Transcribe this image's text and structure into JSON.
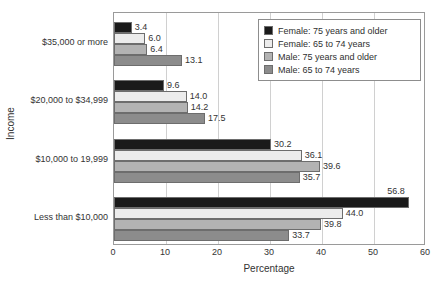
{
  "clipped_title_fragment": "",
  "chart_data": {
    "type": "bar",
    "orientation": "horizontal",
    "title": "",
    "xlabel": "Percentage",
    "ylabel": "Income",
    "xlim": [
      0,
      60
    ],
    "xticks": [
      0,
      10,
      20,
      30,
      40,
      50,
      60
    ],
    "grid": true,
    "legend_position": "top-right",
    "categories": [
      "$35,000 or more",
      "$20,000 to $34,999",
      "$10,000 to 19,999",
      "Less than $10,000"
    ],
    "series": [
      {
        "name": "Female: 75 years and older",
        "color": "#1a1a1a",
        "values": [
          3.4,
          9.6,
          30.2,
          56.8
        ],
        "labels": [
          "3.4",
          "9.6",
          "30.2",
          "56.8"
        ]
      },
      {
        "name": "Female: 65 to 74 years",
        "color": "#ececec",
        "values": [
          6.0,
          14.0,
          36.1,
          44.0
        ],
        "labels": [
          "6.0",
          "14.0",
          "36.1",
          "44.0"
        ]
      },
      {
        "name": "Male: 75 years and older",
        "color": "#b3b3b3",
        "values": [
          6.4,
          14.2,
          39.6,
          39.8
        ],
        "labels": [
          "6.4",
          "14.2",
          "39.6",
          "39.8"
        ]
      },
      {
        "name": "Male: 65 to 74 years",
        "color": "#8c8c8c",
        "values": [
          13.1,
          17.5,
          35.7,
          33.7
        ],
        "labels": [
          "13.1",
          "17.5",
          "35.7",
          "33.7"
        ]
      }
    ]
  },
  "axis": {
    "x_title": "Percentage",
    "y_title": "Income",
    "x_tick_labels": [
      "0",
      "10",
      "20",
      "30",
      "40",
      "50",
      "60"
    ],
    "y_tick_labels": [
      "$35,000 or more",
      "$20,000 to $34,999",
      "$10,000 to 19,999",
      "Less than $10,000"
    ]
  },
  "legend": {
    "items": [
      {
        "label": "Female: 75 years and older",
        "color": "#1a1a1a"
      },
      {
        "label": "Female: 65 to 74 years",
        "color": "#ececec"
      },
      {
        "label": "Male: 75 years and older",
        "color": "#b3b3b3"
      },
      {
        "label": "Male: 65 to 74 years",
        "color": "#8c8c8c"
      }
    ]
  }
}
